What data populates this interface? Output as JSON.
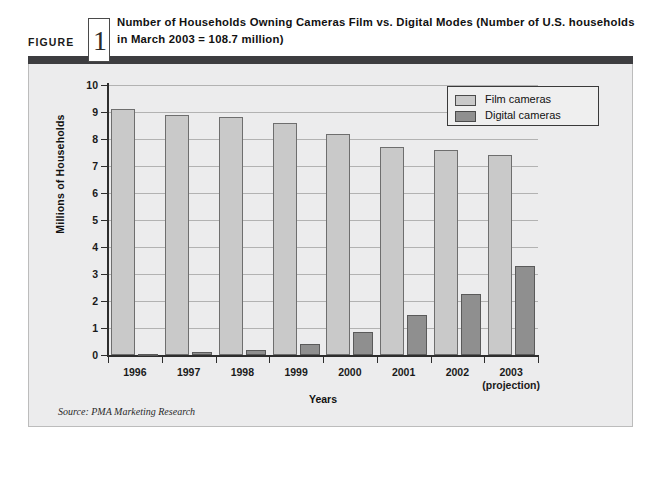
{
  "figure": {
    "label": "FIGURE",
    "number": "1",
    "title": "Number of Households Owning Cameras Film vs. Digital Modes (Number of U.S. households in March 2003 = 108.7 million)",
    "source": "Source: PMA Marketing Research"
  },
  "legend": {
    "position": "top-right",
    "items": [
      {
        "label": "Film cameras",
        "color": "#c9c9c9"
      },
      {
        "label": "Digital cameras",
        "color": "#8f8f8f"
      }
    ]
  },
  "colors": {
    "film": "#c9c9c9",
    "digital": "#8f8f8f",
    "panel_background": "#ececed",
    "header_rule": "#3d3d40",
    "axis": "#2d2d2d",
    "gridline": "#b2b2b2"
  },
  "chart_data": {
    "type": "bar",
    "title": "Number of Households Owning Cameras Film vs. Digital Modes (Number of U.S. households in March 2003 = 108.7 million)",
    "xlabel": "Years",
    "ylabel": "Millions of Households",
    "ylim": [
      0,
      10
    ],
    "yticks": [
      0,
      1,
      2,
      3,
      4,
      5,
      6,
      7,
      8,
      9,
      10
    ],
    "ytick_labels": [
      "0",
      "1",
      "2",
      "3",
      "4",
      "5",
      "6",
      "7",
      "8",
      "9",
      "10"
    ],
    "grid": true,
    "legend": [
      "Film cameras",
      "Digital cameras"
    ],
    "legend_position": "top right",
    "categories": [
      "1996",
      "1997",
      "1998",
      "1999",
      "2000",
      "2001",
      "2002",
      "2003"
    ],
    "category_sublabels": [
      "",
      "",
      "",
      "",
      "",
      "",
      "",
      "(projection)"
    ],
    "series": [
      {
        "name": "Film cameras",
        "values": [
          9.1,
          8.9,
          8.8,
          8.6,
          8.2,
          7.7,
          7.6,
          7.4
        ]
      },
      {
        "name": "Digital cameras",
        "values": [
          0.05,
          0.1,
          0.2,
          0.4,
          0.85,
          1.5,
          2.25,
          3.3
        ]
      }
    ]
  }
}
